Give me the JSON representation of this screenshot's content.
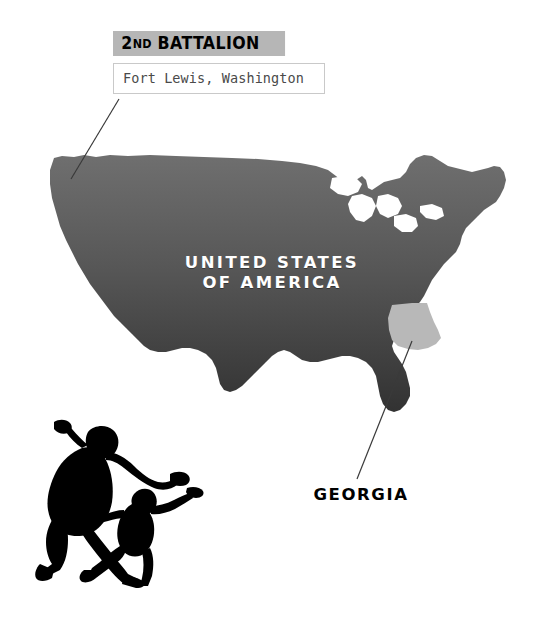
{
  "page": {
    "background_color": "#ffffff",
    "width": 544,
    "height": 620
  },
  "callout": {
    "title_prefix": "2",
    "title_ordinal": "ND",
    "title_rest": " BATTALION",
    "title_full": "2ND BATTALION",
    "title_background": "#b6b6b6",
    "title_color": "#000000",
    "subtitle": "Fort Lewis, Washington",
    "subtitle_color": "#4a4a4a",
    "subtitle_border_color": "#c9c9c9"
  },
  "map": {
    "caption_line1": "UNITED STATES",
    "caption_line2": "OF AMERICA",
    "caption_color": "#ffffff",
    "fill_top_color": "#6b6b6b",
    "fill_bottom_color": "#333333",
    "highlight_state": "Georgia",
    "highlight_color": "#b8b8b8",
    "leader_line_color": "#3a3a3a"
  },
  "georgia": {
    "label": "GEORGIA",
    "label_color": "#000000"
  },
  "silhouettes": {
    "color": "#000000",
    "figure_large": "paratrooper-large",
    "figure_small": "paratrooper-small"
  }
}
